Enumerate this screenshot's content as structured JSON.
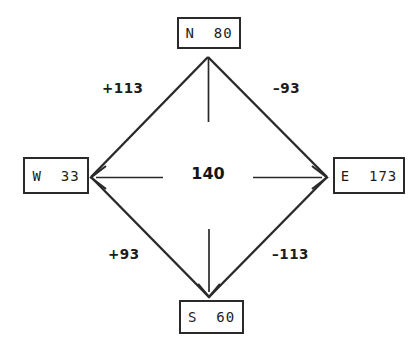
{
  "diagram": {
    "type": "flow-balance-diamond",
    "background_color": "#ffffff",
    "line_color": "#2a2a2a",
    "text_color": "#1c1c1c",
    "center": {
      "value": "140"
    },
    "nodes": [
      {
        "id": "north",
        "label": "N  80",
        "direction": "N",
        "value": 80
      },
      {
        "id": "west",
        "label": "W  33",
        "direction": "W",
        "value": 33
      },
      {
        "id": "east",
        "label": "E  173",
        "direction": "E",
        "value": 173
      },
      {
        "id": "south",
        "label": "S  60",
        "direction": "S",
        "value": 60
      }
    ],
    "edge_labels": [
      {
        "id": "north-west",
        "label": "+113",
        "value": 113,
        "position": "upper-left"
      },
      {
        "id": "north-east",
        "label": "–93",
        "value": -93,
        "position": "upper-right"
      },
      {
        "id": "south-west",
        "label": "+93",
        "value": 93,
        "position": "lower-left"
      },
      {
        "id": "south-east",
        "label": "–113",
        "value": -113,
        "position": "lower-right"
      }
    ],
    "geometry": {
      "vertex_north": [
        208,
        57
      ],
      "vertex_west": [
        91,
        177
      ],
      "vertex_east": [
        327,
        177
      ],
      "vertex_south": [
        209,
        297
      ]
    }
  }
}
